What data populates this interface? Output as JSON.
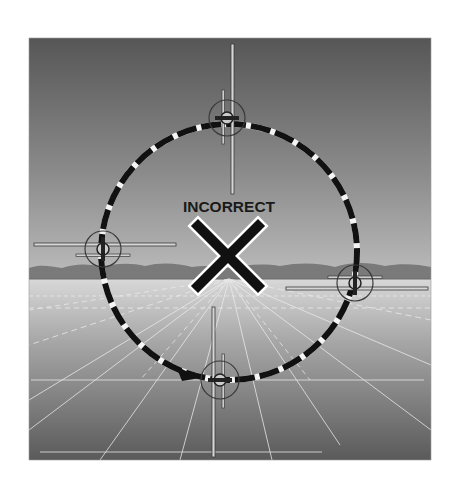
{
  "figure": {
    "title_label": "INCORRECT",
    "mark": "x-mark",
    "colors": {
      "background": "#ffffff",
      "sky_top": "#5a5a5a",
      "sky_horizon": "#b8b8b8",
      "mountains": "#7d7d7d",
      "ground_horizon": "#d4d4d4",
      "ground_bottom": "#5a5a5a",
      "path_dash": "#111111",
      "path_gap": "#f4f4f4",
      "x_mark": "#111111",
      "x_outline": "#ffffff",
      "grid_lines": "#e8e8e8"
    },
    "aircraft_positions": [
      {
        "name": "top",
        "view": "banked-vertical",
        "position": "12 o'clock"
      },
      {
        "name": "left",
        "view": "wings-level",
        "position": "9 o'clock"
      },
      {
        "name": "right",
        "view": "wings-level",
        "position": "3 o'clock"
      },
      {
        "name": "bottom",
        "view": "banked-vertical",
        "position": "6 o'clock"
      }
    ],
    "path_direction": "counterclockwise arrow entering bottom aircraft from left"
  }
}
